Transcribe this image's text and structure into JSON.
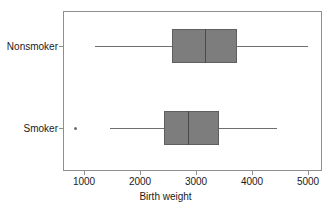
{
  "chart_data": {
    "type": "box",
    "title": "",
    "xlabel": "Birth weight",
    "ylabel": "",
    "orientation": "horizontal",
    "xlim": [
      500,
      5500
    ],
    "xticks": [
      1000,
      2000,
      3000,
      4000,
      5000
    ],
    "xticklabels": [
      "1000",
      "2000",
      "3000",
      "4000",
      "5000"
    ],
    "categories": [
      "Nonsmoker",
      "Smoker"
    ],
    "grid": false,
    "legend": null,
    "box_color": "#7d7d7d",
    "line_color": "#6f6f6f",
    "frame_color": "#8e8e8e",
    "boxes": [
      {
        "category": "Nonsmoker",
        "whisker_low": 1196,
        "q1": 2571,
        "median": 3161,
        "q3": 3732,
        "whisker_high": 5000,
        "outliers": []
      },
      {
        "category": "Smoker",
        "whisker_low": 1464,
        "q1": 2429,
        "median": 2857,
        "q3": 3411,
        "whisker_high": 4446,
        "outliers": [
          857
        ]
      }
    ]
  },
  "axis": {
    "x_title": "Birth weight",
    "tick_1": "1000",
    "tick_2": "2000",
    "tick_3": "3000",
    "tick_4": "4000",
    "tick_5": "5000"
  },
  "categories": {
    "nonsmoker": "Nonsmoker",
    "smoker": "Smoker"
  }
}
